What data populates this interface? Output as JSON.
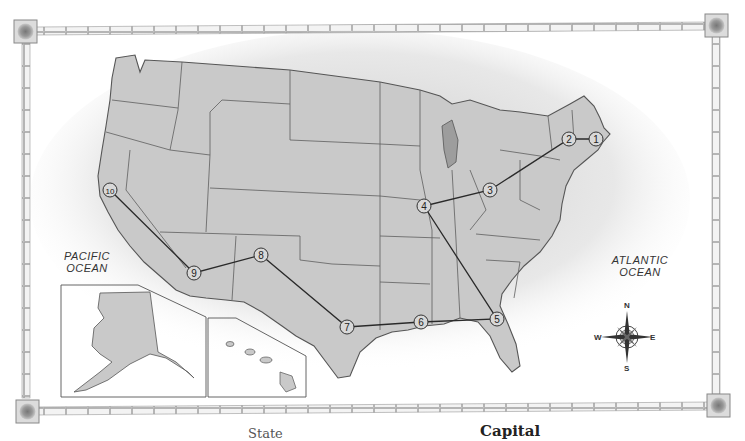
{
  "map": {
    "title": "United States route map",
    "labels": {
      "pacific": "PACIFIC\nOCEAN",
      "atlantic": "ATLANTIC\nOCEAN"
    },
    "compass": {
      "north": "N",
      "south": "S",
      "east": "E",
      "west": "W"
    },
    "route_stops": [
      {
        "number": "1",
        "x": 596,
        "y": 139
      },
      {
        "number": "2",
        "x": 569,
        "y": 139
      },
      {
        "number": "3",
        "x": 490,
        "y": 190
      },
      {
        "number": "4",
        "x": 424,
        "y": 206
      },
      {
        "number": "5",
        "x": 497,
        "y": 319
      },
      {
        "number": "6",
        "x": 421,
        "y": 322
      },
      {
        "number": "7",
        "x": 347,
        "y": 327
      },
      {
        "number": "8",
        "x": 261,
        "y": 255
      },
      {
        "number": "9",
        "x": 194,
        "y": 273
      },
      {
        "number": "10",
        "x": 110,
        "y": 190
      }
    ],
    "colors": {
      "land": "#c9c9c9",
      "border": "#5a5a5a",
      "route": "#2a2a2a"
    }
  },
  "footer": {
    "state_header": "State",
    "capital_header": "Capital"
  }
}
